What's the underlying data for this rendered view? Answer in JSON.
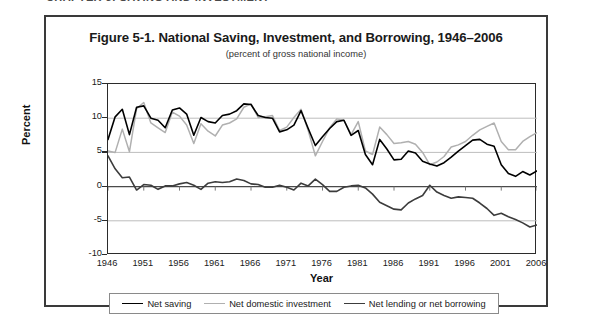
{
  "page_header": {
    "text": "CHAPTER 5: SAVING AND INVESTMENT"
  },
  "figure": {
    "title": "Figure 5-1. National Saving, Investment, and Borrowing, 1946–2006",
    "subtitle": "(percent of gross national income)",
    "x_axis_title": "Year",
    "y_axis_title": "Percent"
  },
  "legend": {
    "entries": [
      {
        "label": "Net saving",
        "color": "#000000"
      },
      {
        "label": "Net domestic investment",
        "color": "#b0b0b0"
      },
      {
        "label": "Net lending or net borrowing",
        "color": "#3c3c3c"
      }
    ]
  },
  "axes": {
    "y_ticks": [
      "15",
      "10",
      "5",
      "0",
      "-5",
      "-10"
    ],
    "x_ticks": [
      "1946",
      "1951",
      "1956",
      "1961",
      "1966",
      "1971",
      "1976",
      "1981",
      "1986",
      "1991",
      "1996",
      "2001",
      "2006"
    ]
  },
  "chart_data": {
    "type": "line",
    "title": "Figure 5-1. National Saving, Investment, and Borrowing, 1946–2006",
    "subtitle": "(percent of gross national income)",
    "xlabel": "Year",
    "ylabel": "Percent",
    "xlim": [
      1946,
      2006
    ],
    "ylim": [
      -10,
      15
    ],
    "y_ticks": [
      15,
      10,
      5,
      0,
      -5,
      -10
    ],
    "x_ticks": [
      1946,
      1951,
      1956,
      1961,
      1966,
      1971,
      1976,
      1981,
      1986,
      1991,
      1996,
      2001,
      2006
    ],
    "grid": "horizontal",
    "legend_position": "bottom",
    "x": [
      1946,
      1947,
      1948,
      1949,
      1950,
      1951,
      1952,
      1953,
      1954,
      1955,
      1956,
      1957,
      1958,
      1959,
      1960,
      1961,
      1962,
      1963,
      1964,
      1965,
      1966,
      1967,
      1968,
      1969,
      1970,
      1971,
      1972,
      1973,
      1974,
      1975,
      1976,
      1977,
      1978,
      1979,
      1980,
      1981,
      1982,
      1983,
      1984,
      1985,
      1986,
      1987,
      1988,
      1989,
      1990,
      1991,
      1992,
      1993,
      1994,
      1995,
      1996,
      1997,
      1998,
      1999,
      2000,
      2001,
      2002,
      2003,
      2004,
      2005,
      2006
    ],
    "series": [
      {
        "name": "Net saving",
        "color": "#000000",
        "values": [
          6.9,
          10.2,
          11.3,
          7.6,
          11.6,
          11.8,
          10.0,
          9.7,
          8.6,
          11.2,
          11.5,
          10.6,
          7.5,
          10.1,
          9.5,
          9.3,
          10.4,
          10.6,
          11.1,
          12.1,
          12.0,
          10.4,
          10.1,
          10.0,
          8.0,
          8.3,
          9.0,
          11.1,
          8.5,
          6.0,
          7.3,
          8.5,
          9.5,
          9.7,
          7.5,
          8.2,
          4.7,
          3.2,
          6.9,
          5.5,
          3.9,
          4.0,
          5.2,
          4.9,
          3.7,
          3.3,
          3.0,
          3.5,
          4.3,
          5.2,
          6.0,
          6.8,
          6.9,
          6.2,
          5.9,
          3.2,
          1.9,
          1.5,
          2.2,
          1.7,
          2.3
        ]
      },
      {
        "name": "Net domestic investment",
        "color": "#b0b0b0",
        "values": [
          5.2,
          5.0,
          8.4,
          5.1,
          11.4,
          12.3,
          9.3,
          8.6,
          7.9,
          10.9,
          10.3,
          9.0,
          6.3,
          9.2,
          8.1,
          7.4,
          9.0,
          9.3,
          9.9,
          11.6,
          12.1,
          10.1,
          10.2,
          10.4,
          8.2,
          8.7,
          10.1,
          11.3,
          8.2,
          4.5,
          6.6,
          8.6,
          9.9,
          9.7,
          7.6,
          9.5,
          5.2,
          4.7,
          8.7,
          7.6,
          6.3,
          6.4,
          6.6,
          6.2,
          5.0,
          3.2,
          3.6,
          4.4,
          5.8,
          6.1,
          6.6,
          7.5,
          8.3,
          8.8,
          9.3,
          6.6,
          5.4,
          5.4,
          6.6,
          7.3,
          7.9
        ]
      },
      {
        "name": "Net lending or net borrowing",
        "color": "#3c3c3c",
        "values": [
          4.5,
          2.6,
          1.3,
          1.4,
          -0.5,
          0.3,
          0.2,
          -0.4,
          0.1,
          0.1,
          0.4,
          0.6,
          0.2,
          -0.4,
          0.5,
          0.7,
          0.6,
          0.7,
          1.1,
          0.9,
          0.4,
          0.3,
          -0.1,
          -0.1,
          0.2,
          -0.1,
          -0.5,
          0.5,
          0.1,
          1.1,
          0.3,
          -0.7,
          -0.7,
          -0.1,
          0.1,
          0.2,
          -0.2,
          -1.1,
          -2.3,
          -2.8,
          -3.3,
          -3.4,
          -2.4,
          -1.8,
          -1.3,
          0.2,
          -0.8,
          -1.3,
          -1.7,
          -1.5,
          -1.6,
          -1.7,
          -2.4,
          -3.2,
          -4.2,
          -3.9,
          -4.4,
          -4.8,
          -5.3,
          -5.9,
          -5.6
        ]
      }
    ]
  }
}
